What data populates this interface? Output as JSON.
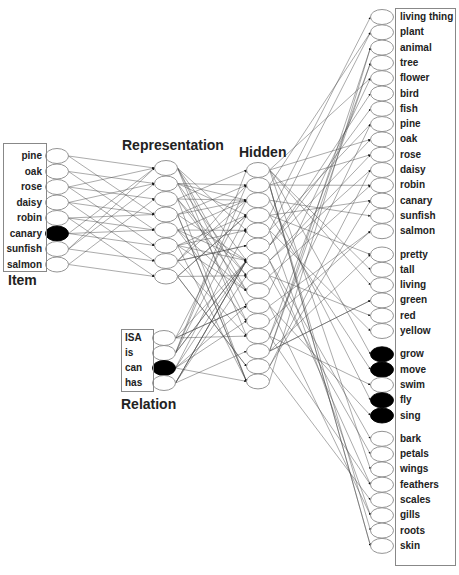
{
  "titles": {
    "item": "Item",
    "representation": "Representation",
    "hidden": "Hidden",
    "relation": "Relation"
  },
  "colors": {
    "unit_fill": "#ffffff",
    "unit_active": "#000000",
    "unit_stroke": "#888888",
    "edge": "#444444",
    "box": "#888888"
  },
  "item_units": [
    {
      "label": "pine",
      "active": false
    },
    {
      "label": "oak",
      "active": false
    },
    {
      "label": "rose",
      "active": false
    },
    {
      "label": "daisy",
      "active": false
    },
    {
      "label": "robin",
      "active": false
    },
    {
      "label": "canary",
      "active": true
    },
    {
      "label": "sunfish",
      "active": false
    },
    {
      "label": "salmon",
      "active": false
    }
  ],
  "relation_units": [
    {
      "label": "ISA",
      "active": false
    },
    {
      "label": "is",
      "active": false
    },
    {
      "label": "can",
      "active": true
    },
    {
      "label": "has",
      "active": false
    }
  ],
  "representation_unit_count": 8,
  "hidden_unit_count": 15,
  "attribute_groups": [
    {
      "name": "isa",
      "units": [
        {
          "label": "living thing",
          "active": false
        },
        {
          "label": "plant",
          "active": false
        },
        {
          "label": "animal",
          "active": false
        },
        {
          "label": "tree",
          "active": false
        },
        {
          "label": "flower",
          "active": false
        },
        {
          "label": "bird",
          "active": false
        },
        {
          "label": "fish",
          "active": false
        },
        {
          "label": "pine",
          "active": false
        },
        {
          "label": "oak",
          "active": false
        },
        {
          "label": "rose",
          "active": false
        },
        {
          "label": "daisy",
          "active": false
        },
        {
          "label": "robin",
          "active": false
        },
        {
          "label": "canary",
          "active": false
        },
        {
          "label": "sunfish",
          "active": false
        },
        {
          "label": "salmon",
          "active": false
        }
      ]
    },
    {
      "name": "is",
      "units": [
        {
          "label": "pretty",
          "active": false
        },
        {
          "label": "tall",
          "active": false
        },
        {
          "label": "living",
          "active": false
        },
        {
          "label": "green",
          "active": false
        },
        {
          "label": "red",
          "active": false
        },
        {
          "label": "yellow",
          "active": false
        }
      ]
    },
    {
      "name": "can",
      "units": [
        {
          "label": "grow",
          "active": true
        },
        {
          "label": "move",
          "active": true
        },
        {
          "label": "swim",
          "active": false
        },
        {
          "label": "fly",
          "active": true
        },
        {
          "label": "sing",
          "active": true
        }
      ]
    },
    {
      "name": "has",
      "units": [
        {
          "label": "bark",
          "active": false
        },
        {
          "label": "petals",
          "active": false
        },
        {
          "label": "wings",
          "active": false
        },
        {
          "label": "feathers",
          "active": false
        },
        {
          "label": "scales",
          "active": false
        },
        {
          "label": "gills",
          "active": false
        },
        {
          "label": "roots",
          "active": false
        },
        {
          "label": "skin",
          "active": false
        }
      ]
    }
  ]
}
